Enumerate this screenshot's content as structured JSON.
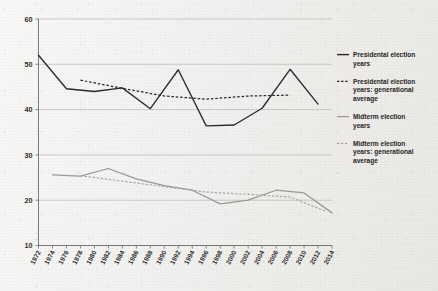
{
  "chart_data": {
    "type": "line",
    "title": "",
    "subtitle": "",
    "xlabel": "",
    "ylabel": "",
    "grid": true,
    "legend_position": "right",
    "xlim": [
      1972,
      2014
    ],
    "ylim": [
      10,
      60
    ],
    "x_tick_labels": [
      "1972",
      "1974",
      "1976",
      "1978",
      "1980",
      "1982",
      "1984",
      "1986",
      "1988",
      "1990",
      "1992",
      "1994",
      "1996",
      "1998",
      "2000",
      "2002",
      "2004",
      "2006",
      "2008",
      "2010",
      "2012",
      "2014"
    ],
    "y_tick_labels": [
      "10",
      "20",
      "30",
      "40",
      "50",
      "60"
    ],
    "y_ticks": [
      10,
      20,
      30,
      40,
      50,
      60
    ],
    "series": [
      {
        "name": "Presidental election years",
        "style": "solid",
        "color": "#2b2b2b",
        "x": [
          1972,
          1976,
          1980,
          1984,
          1988,
          1992,
          1996,
          2000,
          2004,
          2008,
          2012
        ],
        "values": [
          52.0,
          44.6,
          44.0,
          44.8,
          40.2,
          48.8,
          36.4,
          36.6,
          40.3,
          48.9,
          41.2
        ]
      },
      {
        "name": "Presidental election years: generational average",
        "style": "dashed",
        "color": "#2b2b2b",
        "x": [
          1978,
          1984,
          1990,
          1996,
          2002,
          2008
        ],
        "values": [
          46.5,
          44.7,
          43.0,
          42.3,
          43.0,
          43.2
        ]
      },
      {
        "name": "Midterm election years",
        "style": "solid",
        "color": "#9a9a96",
        "x": [
          1974,
          1978,
          1982,
          1986,
          1990,
          1994,
          1998,
          2002,
          2006,
          2010,
          2014
        ],
        "values": [
          25.6,
          25.3,
          27.0,
          24.7,
          23.2,
          22.2,
          19.2,
          20.0,
          22.2,
          21.6,
          17.2
        ]
      },
      {
        "name": "Midterm election years: generational average",
        "style": "dashed",
        "color": "#a6a6a1",
        "x": [
          1978,
          1984,
          1990,
          1996,
          2002,
          2008,
          2013
        ],
        "values": [
          25.4,
          24.2,
          23.0,
          21.8,
          21.3,
          20.7,
          17.6
        ]
      }
    ]
  },
  "legend": {
    "items": [
      {
        "label": "Presidental election years",
        "style": "solid-dark"
      },
      {
        "label": "Presidental election years: generational average",
        "style": "dashed-dark"
      },
      {
        "label": "Midterm election years",
        "style": "solid-light"
      },
      {
        "label": "Midterm election years: generational average",
        "style": "dashed-light"
      }
    ]
  },
  "colors": {
    "background": "#f1f0ed",
    "gridline": "#b9b9b4",
    "axis": "#6e6e6a",
    "presidential": "#2b2b2b",
    "midterm": "#9a9a96"
  }
}
